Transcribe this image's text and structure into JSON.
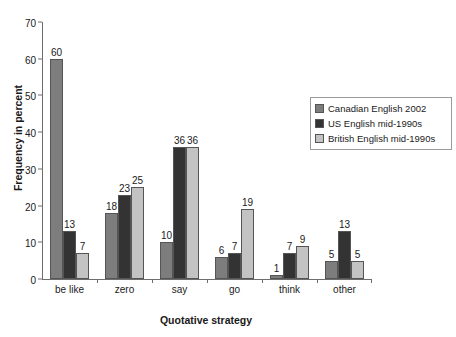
{
  "chart_data": {
    "type": "bar",
    "title": "",
    "subtitle": "",
    "xlabel": "Quotative strategy",
    "ylabel": "Frequency in percent",
    "categories": [
      "be like",
      "zero",
      "say",
      "go",
      "think",
      "other"
    ],
    "series": [
      {
        "name": "Canadian English 2002",
        "color": "#7d7d7d",
        "values": [
          60,
          18,
          10,
          6,
          1,
          5
        ]
      },
      {
        "name": "US English mid-1990s",
        "color": "#333333",
        "values": [
          13,
          23,
          36,
          7,
          7,
          13
        ]
      },
      {
        "name": "British English mid-1990s",
        "color": "#c3c3c3",
        "values": [
          7,
          25,
          36,
          19,
          9,
          5
        ]
      }
    ],
    "ylim": [
      0,
      70
    ],
    "yticks": [
      0,
      10,
      20,
      30,
      40,
      50,
      60,
      70
    ],
    "ytick_labels": [
      "0",
      "10",
      "20",
      "30",
      "40",
      "50",
      "60",
      "70"
    ],
    "grid": false,
    "data_labels": true,
    "legend_position": "upper-right",
    "legend_border_color": "#9a9a9a",
    "axis_color": "#6e6e6e",
    "background": "#ffffff",
    "text_color": "#1a1a1a"
  }
}
